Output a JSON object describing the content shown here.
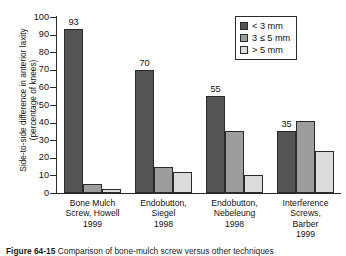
{
  "figure": {
    "caption_label": "Figure 64-15",
    "caption_text": "Comparison of bone-mulch screw versus other techniques"
  },
  "legend": {
    "position": "top-right",
    "items": [
      {
        "label": "< 3 mm",
        "color": "#545454"
      },
      {
        "label": "3 ≤ 5 mm",
        "color": "#9d9d9d"
      },
      {
        "label": "> 5 mm",
        "color": "#dcdcdc"
      }
    ]
  },
  "axes": {
    "ylabel_line1": "Side-to-side difference in anterior laxity",
    "ylabel_line2": "(percentage of knees)",
    "yticks": [
      0,
      10,
      20,
      30,
      40,
      50,
      60,
      70,
      80,
      90,
      100
    ],
    "ymin": 0,
    "ymax": 100
  },
  "chart_data": {
    "type": "bar",
    "title": "",
    "xlabel": "",
    "ylabel": "Side-to-side difference in anterior laxity (percentage of knees)",
    "ylim": [
      0,
      100
    ],
    "yticks": [
      0,
      10,
      20,
      30,
      40,
      50,
      60,
      70,
      80,
      90,
      100
    ],
    "grid": false,
    "legend_position": "upper right",
    "categories": [
      "Bone Mulch Screw, Howell 1999",
      "Endobutton, Siegel 1998",
      "Endobutton, Nebeleung 1998",
      "Interference Screws, Barber 1999"
    ],
    "category_lines": [
      [
        "Bone Mulch",
        "Screw, Howell",
        "1999"
      ],
      [
        "Endobutton,",
        "Siegel",
        "1998"
      ],
      [
        "Endobutton,",
        "Nebeleung",
        "1998"
      ],
      [
        "Interference",
        "Screws,",
        "Barber",
        "1999"
      ]
    ],
    "series": [
      {
        "name": "< 3 mm",
        "color": "#545454",
        "values": [
          93,
          70,
          55,
          35
        ],
        "labels": [
          "93",
          "70",
          "55",
          "35"
        ]
      },
      {
        "name": "3 ≤ 5 mm",
        "color": "#9d9d9d",
        "values": [
          5,
          15,
          35,
          41
        ],
        "labels": [
          "",
          "",
          "",
          ""
        ]
      },
      {
        "name": "> 5 mm",
        "color": "#dcdcdc",
        "values": [
          2,
          12,
          10,
          24
        ],
        "labels": [
          "",
          "",
          "",
          ""
        ]
      }
    ]
  }
}
